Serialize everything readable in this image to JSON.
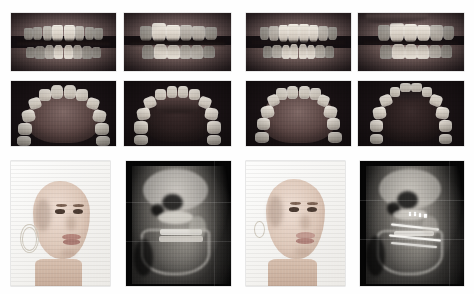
{
  "figure": {
    "type": "orthodontic-clinical-photo-montage",
    "background_color": "#ffffff",
    "columns": 4,
    "rows": 3,
    "groups": [
      {
        "id": "pretreatment",
        "label": "",
        "column_span": [
          1,
          2
        ]
      },
      {
        "id": "posttreatment",
        "label": "",
        "column_span": [
          3,
          4
        ]
      }
    ]
  },
  "panels": [
    {
      "id": "p1",
      "row": 1,
      "col": 1,
      "group": "pretreatment",
      "view": "intraoral-frontal",
      "caption": "",
      "modality": "intraoral photograph",
      "x": 11,
      "y": 13,
      "w": 105,
      "h": 58
    },
    {
      "id": "p2",
      "row": 1,
      "col": 2,
      "group": "pretreatment",
      "view": "intraoral-lateral-right",
      "caption": "",
      "modality": "intraoral photograph",
      "x": 124,
      "y": 13,
      "w": 107,
      "h": 58
    },
    {
      "id": "p3",
      "row": 1,
      "col": 3,
      "group": "posttreatment",
      "view": "intraoral-frontal",
      "caption": "",
      "modality": "intraoral photograph",
      "x": 246,
      "y": 13,
      "w": 105,
      "h": 58
    },
    {
      "id": "p4",
      "row": 1,
      "col": 4,
      "group": "posttreatment",
      "view": "intraoral-lateral-left",
      "caption": "",
      "modality": "intraoral photograph",
      "x": 358,
      "y": 13,
      "w": 106,
      "h": 58
    },
    {
      "id": "p5",
      "row": 2,
      "col": 1,
      "group": "pretreatment",
      "view": "occlusal-maxillary",
      "caption": "",
      "modality": "intraoral photograph",
      "x": 11,
      "y": 81,
      "w": 105,
      "h": 65
    },
    {
      "id": "p6",
      "row": 2,
      "col": 2,
      "group": "pretreatment",
      "view": "occlusal-mandibular",
      "caption": "",
      "modality": "intraoral photograph",
      "x": 124,
      "y": 81,
      "w": 107,
      "h": 65
    },
    {
      "id": "p7",
      "row": 2,
      "col": 3,
      "group": "posttreatment",
      "view": "occlusal-maxillary",
      "caption": "",
      "modality": "intraoral photograph",
      "x": 246,
      "y": 81,
      "w": 105,
      "h": 65
    },
    {
      "id": "p8",
      "row": 2,
      "col": 4,
      "group": "posttreatment",
      "view": "occlusal-mandibular",
      "caption": "",
      "modality": "intraoral photograph",
      "x": 358,
      "y": 81,
      "w": 106,
      "h": 65
    },
    {
      "id": "p9",
      "row": 3,
      "col": 1,
      "group": "pretreatment",
      "view": "facial-profile-three-quarter",
      "caption": "",
      "modality": "extraoral photograph",
      "x": 11,
      "y": 161,
      "w": 99,
      "h": 125
    },
    {
      "id": "p10",
      "row": 3,
      "col": 2,
      "group": "pretreatment",
      "view": "lateral-cephalogram",
      "caption": "",
      "modality": "radiograph",
      "appliance_visible": false,
      "x": 126,
      "y": 161,
      "w": 105,
      "h": 125
    },
    {
      "id": "p11",
      "row": 3,
      "col": 3,
      "group": "posttreatment",
      "view": "facial-profile-three-quarter",
      "caption": "",
      "modality": "extraoral photograph",
      "x": 246,
      "y": 161,
      "w": 99,
      "h": 125
    },
    {
      "id": "p12",
      "row": 3,
      "col": 4,
      "group": "posttreatment",
      "view": "lateral-cephalogram",
      "caption": "",
      "modality": "radiograph",
      "appliance_visible": true,
      "x": 360,
      "y": 161,
      "w": 104,
      "h": 125
    }
  ],
  "colors": {
    "page_background": "#ffffff",
    "photo_dark": "#1a1315",
    "radiograph_black": "#050505",
    "tooth_enamel": "#efe9e0",
    "gingiva": "#8e7a78",
    "skin": "#ddc7b8",
    "hair": "#9b8a72",
    "appliance_metal": "#f6f5f1"
  }
}
